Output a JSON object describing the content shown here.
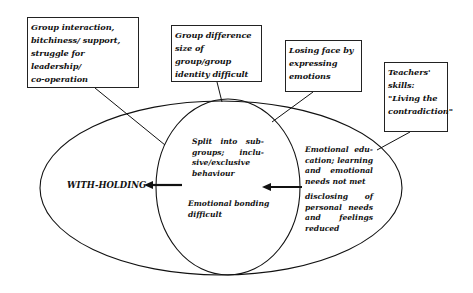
{
  "diagram": {
    "boxes": [
      {
        "id": "group-interaction",
        "lines": [
          "Group interaction,",
          "bitchiness/ support,",
          "struggle for leadership/",
          "co-operation"
        ]
      },
      {
        "id": "group-difference",
        "lines": [
          "Group difference",
          "size of group/group",
          "identity difficult"
        ]
      },
      {
        "id": "losing-face",
        "lines": [
          "Losing face by",
          "expressing",
          "emotions"
        ]
      },
      {
        "id": "teachers-skills",
        "lines": [
          "Teachers'",
          "skills:",
          "\"Living the",
          "contradiction\""
        ]
      }
    ],
    "inner_circle": {
      "top_text": "Split into sub-groups; inclu-sive/exclusive behaviour",
      "bottom_text": "Emotional bonding difficult"
    },
    "right_region": {
      "top_text": "Emotional edu-cation; learning and emotional needs not met",
      "bottom_text": "disclosing of personal needs and feelings reduced"
    },
    "outcome_label": "WITH-HOLDING",
    "colors": {
      "line": "#111111",
      "background": "#ffffff"
    }
  }
}
